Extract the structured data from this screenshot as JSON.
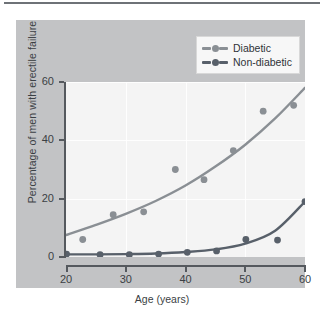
{
  "chart_data": {
    "type": "scatter",
    "title": "",
    "xlabel": "Age (years)",
    "ylabel": "Percentage of men with erectile failure",
    "xlim": [
      20,
      60
    ],
    "ylim": [
      0,
      60
    ],
    "xticks": [
      20,
      30,
      40,
      50,
      60
    ],
    "yticks": [
      0,
      20,
      40,
      60
    ],
    "grid": true,
    "legend_position": "top-right",
    "series": [
      {
        "name": "Diabetic",
        "color": "#8a8f94",
        "marker": "circle",
        "points": [
          {
            "x": 22.8,
            "y": 6
          },
          {
            "x": 27.9,
            "y": 14.5
          },
          {
            "x": 33.0,
            "y": 15.5
          },
          {
            "x": 38.3,
            "y": 30
          },
          {
            "x": 43.1,
            "y": 26.5
          },
          {
            "x": 48.0,
            "y": 36.5
          },
          {
            "x": 53.0,
            "y": 50
          },
          {
            "x": 58.1,
            "y": 52
          }
        ],
        "fit_curve": [
          {
            "x": 20.0,
            "y": 7.5
          },
          {
            "x": 25.0,
            "y": 11.0
          },
          {
            "x": 30.0,
            "y": 14.8
          },
          {
            "x": 35.0,
            "y": 19.2
          },
          {
            "x": 40.0,
            "y": 24.5
          },
          {
            "x": 45.0,
            "y": 31.0
          },
          {
            "x": 50.0,
            "y": 38.5
          },
          {
            "x": 55.0,
            "y": 47.5
          },
          {
            "x": 60.0,
            "y": 58.0
          }
        ]
      },
      {
        "name": "Non-diabetic",
        "color": "#58606a",
        "marker": "circle",
        "points": [
          {
            "x": 20.1,
            "y": 1.0
          },
          {
            "x": 25.7,
            "y": 0.8
          },
          {
            "x": 30.6,
            "y": 0.8
          },
          {
            "x": 35.5,
            "y": 1.0
          },
          {
            "x": 40.3,
            "y": 1.6
          },
          {
            "x": 45.2,
            "y": 2.1
          },
          {
            "x": 50.1,
            "y": 6.0
          },
          {
            "x": 55.4,
            "y": 5.8
          },
          {
            "x": 60.0,
            "y": 19.0
          }
        ],
        "fit_curve": [
          {
            "x": 20.0,
            "y": 0.9
          },
          {
            "x": 25.0,
            "y": 0.9
          },
          {
            "x": 30.0,
            "y": 1.0
          },
          {
            "x": 35.0,
            "y": 1.2
          },
          {
            "x": 40.0,
            "y": 1.7
          },
          {
            "x": 45.0,
            "y": 2.6
          },
          {
            "x": 50.0,
            "y": 4.6
          },
          {
            "x": 55.0,
            "y": 9.0
          },
          {
            "x": 60.0,
            "y": 19.0
          }
        ]
      }
    ]
  },
  "axes": {
    "y_title": "Percentage of men with erectile failure",
    "x_title": "Age (years)",
    "y_tick_labels": [
      "60",
      "40",
      "20",
      "0"
    ],
    "x_tick_labels": [
      "20",
      "30",
      "40",
      "50",
      "60"
    ]
  },
  "legend": {
    "items": [
      {
        "label": "Diabetic",
        "color": "#8a8f94"
      },
      {
        "label": "Non-diabetic",
        "color": "#58606a"
      }
    ]
  },
  "colors": {
    "page_background": "#ffffff",
    "panel_background": "#c2c3c5",
    "plot_background": "#f4f4f4",
    "axis": "#55595e",
    "text": "#3b3f44",
    "gridline": "#ffffff",
    "top_rule": "#6e7277",
    "diabetic": "#8a8f94",
    "non_diabetic": "#58606a"
  }
}
